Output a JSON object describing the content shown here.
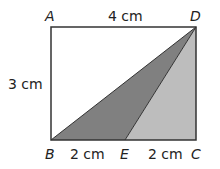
{
  "diagram": {
    "points": {
      "A": {
        "label": "A",
        "x": 51,
        "y": 27
      },
      "D": {
        "label": "D",
        "x": 196,
        "y": 27
      },
      "B": {
        "label": "B",
        "x": 51,
        "y": 140
      },
      "C": {
        "label": "C",
        "x": 196,
        "y": 140
      },
      "E": {
        "label": "E",
        "x": 125,
        "y": 140
      }
    },
    "measurements": {
      "AD": "4 cm",
      "AB": "3 cm",
      "BE": "2 cm",
      "EC": "2 cm"
    },
    "colors": {
      "triangle_BED": "#808080",
      "triangle_ECD": "#bdbdbd",
      "outline": "#333333"
    }
  }
}
